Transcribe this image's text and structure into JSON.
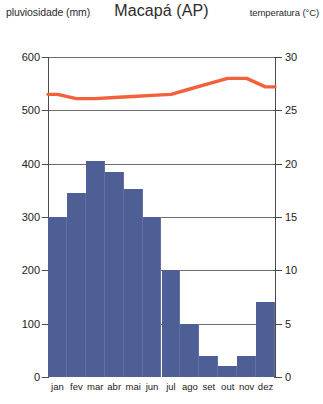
{
  "header": {
    "left_axis_title": "pluviosidade (mm)",
    "title": "Macapá (AP)",
    "right_axis_title": "temperatura (°C)"
  },
  "axes": {
    "left_ticks": [
      "600",
      "500",
      "400",
      "300",
      "200",
      "100",
      "0"
    ],
    "right_ticks": [
      "30",
      "25",
      "20",
      "15",
      "10",
      "5",
      "0"
    ]
  },
  "colors": {
    "bar": "#4e5f96",
    "line": "#f2603c",
    "grid": "#6e6e6e",
    "axis": "#4a4a4a",
    "text": "#222222"
  },
  "chart_data": {
    "type": "bar",
    "title": "Macapá (AP)",
    "subtitle": "",
    "xlabel": "",
    "ylabel": "pluviosidade (mm)",
    "y2label": "temperatura (°C)",
    "categories": [
      "jan",
      "fev",
      "mar",
      "abr",
      "mai",
      "jun",
      "jul",
      "ago",
      "set",
      "out",
      "nov",
      "dez"
    ],
    "ylim": [
      0,
      600
    ],
    "y2lim": [
      0,
      30
    ],
    "yticks": [
      0,
      100,
      200,
      300,
      400,
      500,
      600
    ],
    "y2ticks": [
      0,
      5,
      10,
      15,
      20,
      25,
      30
    ],
    "grid": true,
    "legend": "none",
    "series": [
      {
        "name": "pluviosidade (mm)",
        "type": "bar",
        "axis": "left",
        "color": "#4e5f96",
        "values": [
          300,
          345,
          405,
          385,
          352,
          300,
          200,
          100,
          40,
          20,
          40,
          140
        ]
      },
      {
        "name": "temperatura (°C)",
        "type": "line",
        "axis": "right",
        "color": "#f2603c",
        "values": [
          26.5,
          26.1,
          26.1,
          26.2,
          26.3,
          26.4,
          26.5,
          27.0,
          27.5,
          28.0,
          28.0,
          27.2
        ]
      }
    ]
  }
}
